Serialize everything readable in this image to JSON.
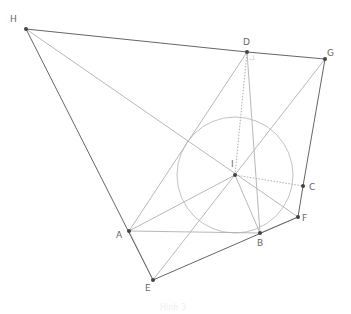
{
  "diagram": {
    "type": "geometry-construction",
    "points": {
      "H": {
        "x": 26,
        "y": 29,
        "label": "H",
        "lx": 10,
        "ly": 22
      },
      "D": {
        "x": 247,
        "y": 52,
        "label": "D",
        "lx": 243,
        "ly": 45
      },
      "G": {
        "x": 325,
        "y": 59,
        "label": "G",
        "lx": 327,
        "ly": 56
      },
      "I": {
        "x": 235,
        "y": 175,
        "label": "I",
        "lx": 231,
        "ly": 167
      },
      "C": {
        "x": 303,
        "y": 186,
        "label": "C",
        "lx": 309,
        "ly": 190
      },
      "F": {
        "x": 298,
        "y": 217,
        "label": "F",
        "lx": 302,
        "ly": 221
      },
      "A": {
        "x": 129,
        "y": 231,
        "label": "A",
        "lx": 116,
        "ly": 238
      },
      "B": {
        "x": 260,
        "y": 233,
        "label": "B",
        "lx": 257,
        "ly": 246
      },
      "E": {
        "x": 153,
        "y": 280,
        "label": "E",
        "lx": 145,
        "ly": 291
      }
    },
    "circle": {
      "center": "I",
      "radius": 58,
      "color": "#bbbbbb"
    },
    "solid_dark_segments": [
      [
        "H",
        "D"
      ],
      [
        "D",
        "G"
      ],
      [
        "H",
        "E"
      ],
      [
        "E",
        "F"
      ],
      [
        "G",
        "C"
      ],
      [
        "C",
        "F"
      ]
    ],
    "solid_light_segments": [
      [
        "A",
        "D"
      ],
      [
        "D",
        "B"
      ],
      [
        "A",
        "B"
      ],
      [
        "H",
        "F"
      ],
      [
        "G",
        "E"
      ],
      [
        "I",
        "A"
      ],
      [
        "I",
        "B"
      ],
      [
        "A",
        "E"
      ],
      [
        "B",
        "F"
      ]
    ],
    "dotted_segments": [
      [
        "I",
        "D"
      ],
      [
        "I",
        "C"
      ]
    ],
    "colors": {
      "dark_line": "#666666",
      "light_line": "#b0b0b0",
      "point": "#444444",
      "label": "#666666"
    },
    "caption": "Hình 3"
  }
}
